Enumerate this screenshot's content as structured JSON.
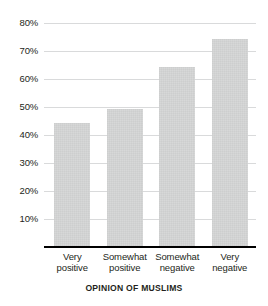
{
  "chart_data": {
    "type": "bar",
    "title": "",
    "subtitle": "",
    "xlabel": "OPINION OF MUSLIMS",
    "ylabel": "",
    "categories": [
      "Very positive",
      "Somewhat positive",
      "Somewhat negative",
      "Very negative"
    ],
    "category_lines": [
      [
        "Very",
        "positive"
      ],
      [
        "Somewhat",
        "positive"
      ],
      [
        "Somewhat",
        "negative"
      ],
      [
        "Very",
        "negative"
      ]
    ],
    "values": [
      44,
      49,
      64,
      74
    ],
    "value_labels": [
      "44%",
      "49%",
      "64%",
      "74%"
    ],
    "ylim": [
      0,
      84
    ],
    "yticks": [
      10,
      20,
      30,
      40,
      50,
      60,
      70,
      80
    ],
    "ytick_labels": [
      "10%",
      "20%",
      "30%",
      "40%",
      "50%",
      "60%",
      "70%",
      "80%"
    ],
    "grid": true,
    "grid_axis": "y",
    "legend": false,
    "legend_position": "none",
    "bar_color": "#d5d6d6",
    "gridline_color": "#d9dadb",
    "axis_color": "#000000",
    "text_color": "#231f20",
    "background_color": "#ffffff"
  }
}
